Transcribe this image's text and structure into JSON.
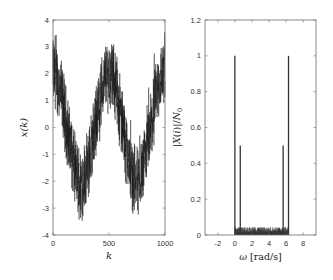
{
  "chart_data": [
    {
      "type": "line",
      "title": "",
      "xlabel": "k",
      "ylabel": "x(k)",
      "xlim": [
        0,
        1000
      ],
      "ylim": [
        -4,
        4
      ],
      "xticks": [
        0,
        500,
        1000
      ],
      "xtick_labels": [
        "0",
        "500",
        "1000"
      ],
      "yticks": [
        -4,
        -3,
        -2,
        -1,
        0,
        1,
        2,
        3,
        4
      ],
      "ytick_labels": [
        "-4",
        "-3",
        "-2",
        "-1",
        "0",
        "1",
        "2",
        "3",
        "4"
      ],
      "grid": false,
      "description": "Noisy sinusoid: amplitude ~2 cosine with period ~500 samples plus dense noise (spread ~±1.3)",
      "series": [
        {
          "name": "x(k)",
          "envelope_points": [
            {
              "k": 0,
              "center": 2.0
            },
            {
              "k": 125,
              "center": 0.0
            },
            {
              "k": 250,
              "center": -2.0
            },
            {
              "k": 375,
              "center": 0.0
            },
            {
              "k": 500,
              "center": 2.0
            },
            {
              "k": 625,
              "center": 0.0
            },
            {
              "k": 750,
              "center": -2.0
            },
            {
              "k": 875,
              "center": 0.0
            },
            {
              "k": 1000,
              "center": 2.0
            }
          ],
          "max_value": 3.8,
          "min_value": -4.0,
          "color": "#1a1a1a"
        }
      ]
    },
    {
      "type": "bar",
      "title": "",
      "xlabel": "ω [rad/s]",
      "ylabel": "|X(i)|/N₀",
      "xlim": [
        -3.5,
        9.5
      ],
      "ylim": [
        0,
        1.2
      ],
      "xticks": [
        -2,
        0,
        2,
        4,
        6,
        8
      ],
      "xtick_labels": [
        "-2",
        "0",
        "2",
        "4",
        "6",
        "8"
      ],
      "yticks": [
        0,
        0.2,
        0.4,
        0.6,
        0.8,
        1,
        1.2
      ],
      "ytick_labels": [
        "0",
        "0.2",
        "0.4",
        "0.6",
        "0.8",
        "1",
        "1.2"
      ],
      "grid": false,
      "series": [
        {
          "name": "spectrum peaks",
          "x": [
            0.0,
            0.63,
            5.65,
            6.28
          ],
          "values": [
            1.0,
            0.5,
            0.5,
            1.0
          ],
          "color": "#333333"
        },
        {
          "name": "noise floor",
          "x_range": [
            0.0,
            6.28
          ],
          "approx_value": 0.03,
          "color": "#333333"
        }
      ]
    }
  ],
  "labels": {
    "left": {
      "xlabel": "k",
      "ylabel_x": "x",
      "ylabel_k": "k"
    },
    "right": {
      "xlabel_omega": "ω",
      "xlabel_unit": "[rad/s]",
      "ylabel": "|X(i)|/N"
    }
  }
}
